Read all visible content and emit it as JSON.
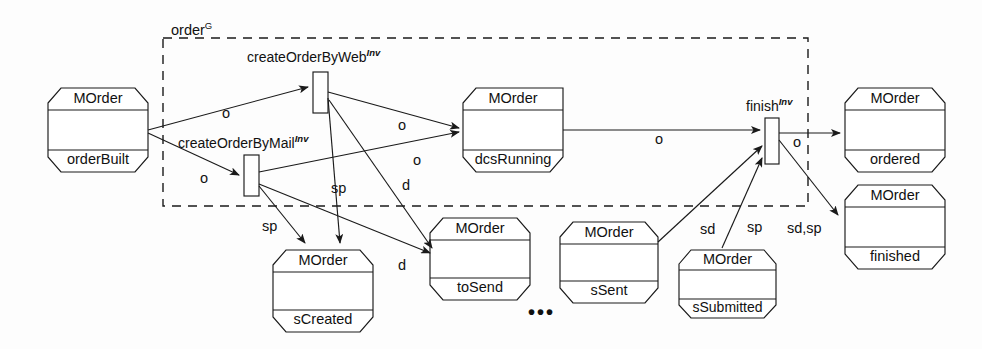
{
  "diagram": {
    "region": {
      "label": "order",
      "superscript": "G",
      "x": 163,
      "y": 38,
      "w": 645,
      "h": 168
    },
    "stroke_color": "#1a1a1a",
    "background": "#fdfdfd",
    "ellipsis": "•••",
    "places": [
      {
        "id": "orderBuilt",
        "type": "MOrder",
        "state": "orderBuilt",
        "x": 48,
        "y": 88,
        "w": 100,
        "h": 84
      },
      {
        "id": "dcsRunning",
        "type": "MOrder",
        "state": "dcsRunning",
        "x": 463,
        "y": 88,
        "w": 100,
        "h": 84
      },
      {
        "id": "ordered",
        "type": "MOrder",
        "state": "ordered",
        "x": 845,
        "y": 88,
        "w": 100,
        "h": 84
      },
      {
        "id": "finished",
        "type": "MOrder",
        "state": "finished",
        "x": 845,
        "y": 185,
        "w": 100,
        "h": 84
      },
      {
        "id": "sCreated",
        "type": "MOrder",
        "state": "sCreated",
        "x": 273,
        "y": 250,
        "w": 100,
        "h": 82
      },
      {
        "id": "toSend",
        "type": "MOrder",
        "state": "toSend",
        "x": 430,
        "y": 218,
        "w": 100,
        "h": 82
      },
      {
        "id": "sSent",
        "type": "MOrder",
        "state": "sSent",
        "x": 560,
        "y": 222,
        "w": 98,
        "h": 81
      },
      {
        "id": "sSubmitted",
        "type": "MOrder",
        "state": "sSubmitted",
        "x": 679,
        "y": 250,
        "w": 97,
        "h": 68
      }
    ],
    "transitions": [
      {
        "id": "createOrderByWeb",
        "label": "createOrderByWeb",
        "superscript": "Inv",
        "x": 313,
        "y": 72,
        "w": 15,
        "h": 41,
        "label_x": 247,
        "label_y": 47
      },
      {
        "id": "createOrderByMail",
        "label": "createOrderByMail",
        "superscript": "Inv",
        "x": 244,
        "y": 155,
        "w": 15,
        "h": 41,
        "label_x": 178,
        "label_y": 133
      },
      {
        "id": "finish",
        "label": "finish",
        "superscript": "Inv",
        "x": 765,
        "y": 118,
        "w": 14,
        "h": 46,
        "label_x": 746,
        "label_y": 96
      }
    ],
    "arc_labels": [
      {
        "text": "o",
        "x": 222,
        "y": 105
      },
      {
        "text": "o",
        "x": 200,
        "y": 170
      },
      {
        "text": "o",
        "x": 398,
        "y": 117
      },
      {
        "text": "o",
        "x": 413,
        "y": 152
      },
      {
        "text": "o",
        "x": 655,
        "y": 131
      },
      {
        "text": "o",
        "x": 793,
        "y": 134
      },
      {
        "text": "sp",
        "x": 331,
        "y": 180
      },
      {
        "text": "sp",
        "x": 262,
        "y": 218
      },
      {
        "text": "d",
        "x": 402,
        "y": 177
      },
      {
        "text": "d",
        "x": 398,
        "y": 257
      },
      {
        "text": "sd",
        "x": 700,
        "y": 221
      },
      {
        "text": "sp",
        "x": 747,
        "y": 219
      },
      {
        "text": "sd,sp",
        "x": 787,
        "y": 220
      }
    ],
    "ellipsis_pos": {
      "x": 528,
      "y": 302
    }
  }
}
